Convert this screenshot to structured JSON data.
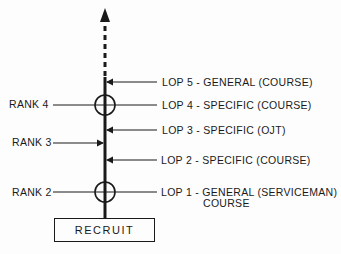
{
  "diagram": {
    "base": {
      "label": "RECRUIT"
    },
    "ranks": [
      {
        "label": "RANK 4"
      },
      {
        "label": "RANK 3"
      },
      {
        "label": "RANK 2"
      }
    ],
    "lops": [
      {
        "label": "LOP 5 - GENERAL (COURSE)"
      },
      {
        "label": "LOP 4 - SPECIFIC (COURSE)"
      },
      {
        "label": "LOP 3 - SPECIFIC (OJT)"
      },
      {
        "label": "LOP 2 - SPECIFIC (COURSE)"
      },
      {
        "label": "LOP 1 - GENERAL (SERVICEMAN)",
        "label_line2": "COURSE"
      }
    ],
    "colors": {
      "line": "#1a1a1a",
      "background": "#fdfdfd"
    }
  }
}
